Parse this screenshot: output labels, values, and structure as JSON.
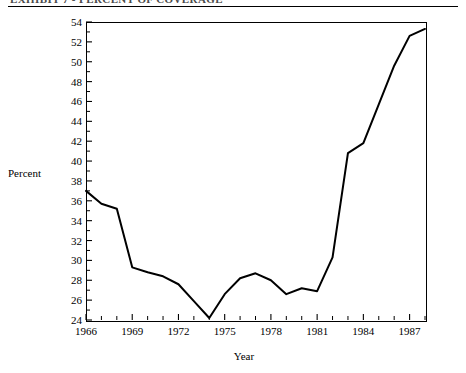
{
  "header": {
    "text": "EXHIBIT 7 - PERCENT OF COVERAGE",
    "clipped": true
  },
  "chart_data": {
    "type": "line",
    "title": "",
    "xlabel": "Year",
    "ylabel": "Percent",
    "xlim": [
      1966,
      1988
    ],
    "ylim": [
      24,
      54
    ],
    "ytick_step": 2,
    "yticks": [
      24,
      26,
      28,
      30,
      32,
      34,
      36,
      38,
      40,
      42,
      44,
      46,
      48,
      50,
      52,
      54
    ],
    "ytick_labels": [
      "24",
      "26",
      "28",
      "30",
      "32",
      "34",
      "36",
      "38",
      "40",
      "42",
      "44",
      "46",
      "48",
      "50",
      "52",
      "54"
    ],
    "xticks": [
      1966,
      1967,
      1968,
      1969,
      1970,
      1971,
      1972,
      1973,
      1974,
      1975,
      1976,
      1977,
      1978,
      1979,
      1980,
      1981,
      1982,
      1983,
      1984,
      1985,
      1986,
      1987,
      1988
    ],
    "xtick_labels_shown": [
      "1966",
      "1969",
      "1972",
      "1975",
      "1978",
      "1981",
      "1984",
      "1987"
    ],
    "xtick_labels_values": [
      1966,
      1969,
      1972,
      1975,
      1978,
      1981,
      1984,
      1987
    ],
    "minor_ticks": true,
    "grid": false,
    "legend": "none",
    "line_color": "#000000",
    "line_width": 2,
    "x": [
      1966,
      1967,
      1968,
      1969,
      1970,
      1971,
      1972,
      1973,
      1974,
      1975,
      1976,
      1977,
      1978,
      1979,
      1980,
      1981,
      1982,
      1983,
      1984,
      1985,
      1986,
      1987,
      1988
    ],
    "values": [
      37.0,
      35.7,
      35.2,
      29.3,
      28.8,
      28.4,
      27.6,
      25.9,
      24.2,
      26.6,
      28.2,
      28.7,
      28.0,
      26.6,
      27.2,
      26.9,
      30.3,
      40.8,
      41.8,
      45.7,
      49.6,
      52.6,
      53.3
    ],
    "series": [
      {
        "name": "Percent",
        "values": [
          37.0,
          35.7,
          35.2,
          29.3,
          28.8,
          28.4,
          27.6,
          25.9,
          24.2,
          26.6,
          28.2,
          28.7,
          28.0,
          26.6,
          27.2,
          26.9,
          30.3,
          40.8,
          41.8,
          45.7,
          49.6,
          52.6,
          53.3
        ]
      }
    ]
  }
}
